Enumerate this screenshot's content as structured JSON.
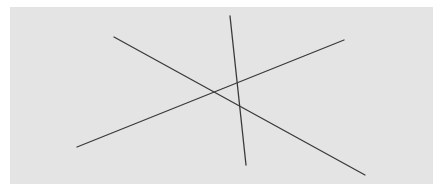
{
  "figure": {
    "background_color": "#e4e4e4",
    "line_color": "#3a3a3a",
    "line_width": 1.3,
    "panel": {
      "x": 10,
      "y": 7,
      "width": 423,
      "height": 177
    },
    "lines": [
      {
        "name": "descending-line",
        "x1": 114,
        "y1": 37,
        "x2": 365,
        "y2": 175
      },
      {
        "name": "ascending-line",
        "x1": 77,
        "y1": 147,
        "x2": 344,
        "y2": 40
      },
      {
        "name": "steep-line",
        "x1": 230,
        "y1": 16,
        "x2": 246,
        "y2": 165
      }
    ]
  }
}
